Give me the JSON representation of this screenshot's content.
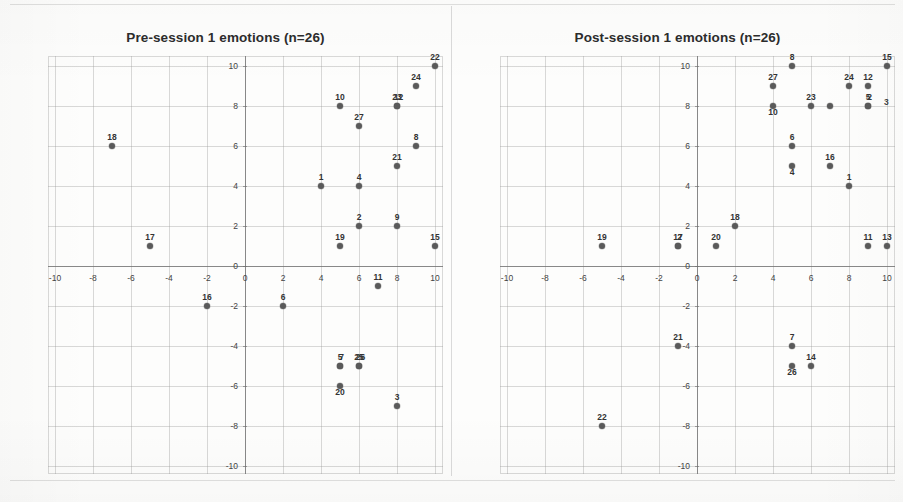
{
  "page": {
    "background_color": "#fdfdfc",
    "point_color": "#5a5a5a",
    "grid_color": "#9b9b9b",
    "axis_color": "#6e6e6e"
  },
  "panels": [
    {
      "id": "pre",
      "title": "Pre-session 1 emotions (n=26)",
      "stray_labels": []
    },
    {
      "id": "post",
      "title": "Post-session 1 emotions (n=26)",
      "stray_labels": [
        {
          "text": "3",
          "x_px": 884,
          "y_px": 97
        }
      ]
    }
  ],
  "axes": {
    "x_ticks": [
      "-10",
      "-8",
      "-6",
      "-4",
      "-2",
      "0",
      "2",
      "4",
      "6",
      "8",
      "10"
    ],
    "y_ticks": [
      "10",
      "8",
      "6",
      "4",
      "2",
      "0",
      "-2",
      "-4",
      "-6",
      "-8",
      "-10"
    ],
    "x_min": -10,
    "x_max": 10,
    "y_min": -10,
    "y_max": 10,
    "x_step": 2,
    "y_step": 2,
    "grid": true
  },
  "chart_data": [
    {
      "type": "scatter",
      "title": "Pre-session 1 emotions (n=26)",
      "xlabel": "",
      "ylabel": "",
      "xlim": [
        -10,
        10
      ],
      "ylim": [
        -10,
        10
      ],
      "grid": true,
      "legend": "none",
      "point_labels_are": "participant-id",
      "n": 26,
      "points": [
        {
          "label": "22",
          "x": 10,
          "y": 10,
          "label_pos": "above"
        },
        {
          "label": "24",
          "x": 9,
          "y": 9,
          "label_pos": "above"
        },
        {
          "label": "10",
          "x": 5,
          "y": 8,
          "label_pos": "above"
        },
        {
          "label": "23",
          "x": 8,
          "y": 8,
          "label_pos": "above"
        },
        {
          "label": "12",
          "x": 8,
          "y": 8,
          "label_pos": "above-overlap"
        },
        {
          "label": "27",
          "x": 6,
          "y": 7,
          "label_pos": "above"
        },
        {
          "label": "18",
          "x": -7,
          "y": 6,
          "label_pos": "above"
        },
        {
          "label": "8",
          "x": 9,
          "y": 6,
          "label_pos": "above"
        },
        {
          "label": "21",
          "x": 8,
          "y": 5,
          "label_pos": "above"
        },
        {
          "label": "1",
          "x": 4,
          "y": 4,
          "label_pos": "above"
        },
        {
          "label": "4",
          "x": 6,
          "y": 4,
          "label_pos": "above"
        },
        {
          "label": "2",
          "x": 6,
          "y": 2,
          "label_pos": "above"
        },
        {
          "label": "9",
          "x": 8,
          "y": 2,
          "label_pos": "above"
        },
        {
          "label": "19",
          "x": 5,
          "y": 1,
          "label_pos": "above"
        },
        {
          "label": "15",
          "x": 10,
          "y": 1,
          "label_pos": "above"
        },
        {
          "label": "17",
          "x": -5,
          "y": 1,
          "label_pos": "above"
        },
        {
          "label": "11",
          "x": 7,
          "y": -1,
          "label_pos": "above"
        },
        {
          "label": "16",
          "x": -2,
          "y": -2,
          "label_pos": "above"
        },
        {
          "label": "6",
          "x": 2,
          "y": -2,
          "label_pos": "above"
        },
        {
          "label": "5",
          "x": 5,
          "y": -5,
          "label_pos": "above"
        },
        {
          "label": "7",
          "x": 5,
          "y": -5,
          "label_pos": "above-overlap"
        },
        {
          "label": "25",
          "x": 6,
          "y": -5,
          "label_pos": "above"
        },
        {
          "label": "26",
          "x": 6,
          "y": -5,
          "label_pos": "above-overlap"
        },
        {
          "label": "20",
          "x": 5,
          "y": -6,
          "label_pos": "above-near"
        },
        {
          "label": "3",
          "x": 8,
          "y": -7,
          "label_pos": "above"
        }
      ]
    },
    {
      "type": "scatter",
      "title": "Post-session 1 emotions (n=26)",
      "xlabel": "",
      "ylabel": "",
      "xlim": [
        -10,
        10
      ],
      "ylim": [
        -10,
        10
      ],
      "grid": true,
      "legend": "none",
      "point_labels_are": "participant-id",
      "n": 26,
      "points": [
        {
          "label": "15",
          "x": 10,
          "y": 10,
          "label_pos": "above"
        },
        {
          "label": "8",
          "x": 5,
          "y": 10,
          "label_pos": "above"
        },
        {
          "label": "27",
          "x": 4,
          "y": 9,
          "label_pos": "above"
        },
        {
          "label": "24",
          "x": 8,
          "y": 9,
          "label_pos": "above"
        },
        {
          "label": "12",
          "x": 9,
          "y": 9,
          "label_pos": "above"
        },
        {
          "label": "10",
          "x": 4,
          "y": 8,
          "label_pos": "above-near"
        },
        {
          "label": "23",
          "x": 6,
          "y": 8,
          "label_pos": "above"
        },
        {
          "label": "25",
          "x": 7,
          "y": 8,
          "label_pos": "none"
        },
        {
          "label": "5",
          "x": 9,
          "y": 8,
          "label_pos": "above"
        },
        {
          "label": "2",
          "x": 9,
          "y": 8,
          "label_pos": "above-overlap"
        },
        {
          "label": "6",
          "x": 5,
          "y": 6,
          "label_pos": "above"
        },
        {
          "label": "4",
          "x": 5,
          "y": 5,
          "label_pos": "above-near"
        },
        {
          "label": "16",
          "x": 7,
          "y": 5,
          "label_pos": "above"
        },
        {
          "label": "1",
          "x": 8,
          "y": 4,
          "label_pos": "above"
        },
        {
          "label": "18",
          "x": 2,
          "y": 2,
          "label_pos": "above"
        },
        {
          "label": "17",
          "x": -1,
          "y": 1,
          "label_pos": "above"
        },
        {
          "label": "2b",
          "x": -1,
          "y": 1,
          "label_pos": "above-overlap",
          "display": "2"
        },
        {
          "label": "20",
          "x": 1,
          "y": 1,
          "label_pos": "above"
        },
        {
          "label": "19",
          "x": -5,
          "y": 1,
          "label_pos": "above"
        },
        {
          "label": "11",
          "x": 9,
          "y": 1,
          "label_pos": "above"
        },
        {
          "label": "13",
          "x": 10,
          "y": 1,
          "label_pos": "above"
        },
        {
          "label": "21",
          "x": -1,
          "y": -4,
          "label_pos": "above"
        },
        {
          "label": "7",
          "x": 5,
          "y": -4,
          "label_pos": "above"
        },
        {
          "label": "26",
          "x": 5,
          "y": -5,
          "label_pos": "above-near"
        },
        {
          "label": "14",
          "x": 6,
          "y": -5,
          "label_pos": "above"
        },
        {
          "label": "22",
          "x": -5,
          "y": -8,
          "label_pos": "above"
        }
      ]
    }
  ]
}
